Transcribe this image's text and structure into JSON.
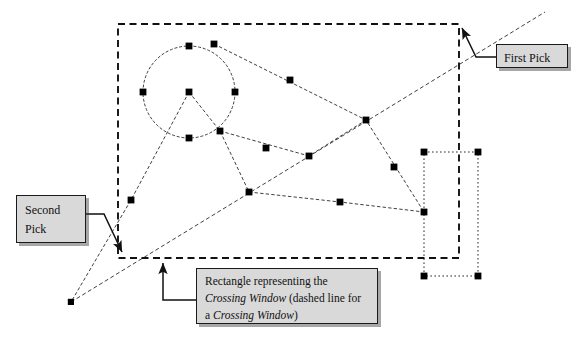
{
  "figure": {
    "background_color": "#ffffff",
    "line_color": "#1a1a1a",
    "grip_color": "#000000",
    "callout_fill": "#d9d9d9",
    "callout_border": "#1a1a1a"
  },
  "callouts": {
    "first_pick": {
      "label": "First Pick"
    },
    "second_pick": {
      "line1": "Second",
      "line2": "Pick"
    },
    "rectangle_note": {
      "line1_a": "Rectangle representing the",
      "line2_a": "Crossing Window",
      "line2_b": " (dashed line for",
      "line3_a": "a ",
      "line3_b": "Crossing Window",
      "line3_c": ")"
    }
  },
  "geometry": {
    "crossing_window": {
      "name": "crossing-window-rectangle",
      "style": "dashed",
      "x": 118,
      "y": 24,
      "width": 341,
      "height": 234
    },
    "dotted_rectangle": {
      "name": "dotted-rectangle",
      "style": "dotted",
      "x": 424,
      "y": 152,
      "width": 54,
      "height": 124
    },
    "circle": {
      "name": "circle-entity",
      "cx": 189,
      "cy": 92,
      "r": 46
    },
    "pick_points": {
      "first_pick_point": {
        "x": 459,
        "y": 24
      },
      "second_pick_point": {
        "x": 120,
        "y": 257
      }
    },
    "grips": [
      {
        "x": 189,
        "y": 46
      },
      {
        "x": 143,
        "y": 92
      },
      {
        "x": 235,
        "y": 92
      },
      {
        "x": 189,
        "y": 92
      },
      {
        "x": 189,
        "y": 138
      },
      {
        "x": 214,
        "y": 44
      },
      {
        "x": 290,
        "y": 80
      },
      {
        "x": 366,
        "y": 120
      },
      {
        "x": 394,
        "y": 167
      },
      {
        "x": 424,
        "y": 212
      },
      {
        "x": 220,
        "y": 131
      },
      {
        "x": 266,
        "y": 148
      },
      {
        "x": 309,
        "y": 156
      },
      {
        "x": 249,
        "y": 192
      },
      {
        "x": 340,
        "y": 202
      },
      {
        "x": 131,
        "y": 200
      },
      {
        "x": 71,
        "y": 302
      },
      {
        "x": 424,
        "y": 152
      },
      {
        "x": 478,
        "y": 152
      },
      {
        "x": 424,
        "y": 276
      },
      {
        "x": 478,
        "y": 276
      }
    ],
    "polylines": [
      {
        "name": "polyline-upper-chain",
        "points": "214,44 366,120 424,212"
      },
      {
        "name": "polyline-mid-chain",
        "points": "220,131 309,156 366,120"
      },
      {
        "name": "polyline-lower-chain",
        "points": "249,192 340,202 424,212"
      },
      {
        "name": "polyline-left-vee",
        "points": "189,92 131,200 71,302"
      },
      {
        "name": "polyline-right-vee",
        "points": "189,92 220,131 249,192"
      },
      {
        "name": "long-diagonal",
        "points": "71,302 545,12"
      }
    ]
  },
  "leaders": {
    "first_pick_leader": {
      "from": "496,58",
      "to": "459,26"
    },
    "second_pick_leader": {
      "from": "86,215",
      "to": "120,254"
    },
    "rectangle_note_leader": {
      "from": "196,300",
      "to": "162,259"
    }
  }
}
